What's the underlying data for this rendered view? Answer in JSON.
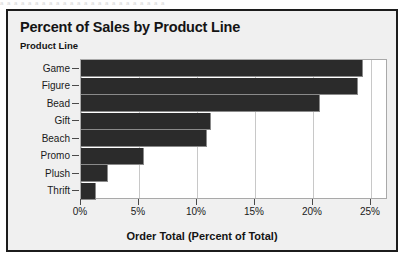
{
  "top_fragment": "a a a a a a a a a a a a a a a a a a a a a a a a",
  "window": {
    "title": "Percent of Sales by Product Line",
    "axis_group_label": "Product Line"
  },
  "colors": {
    "bar": "#2b2b2b",
    "plot_background": "#ffffff",
    "window_background": "#f0f0f0",
    "gridline": "#c8c8c8",
    "border": "#1c1c1c"
  },
  "chart_data": {
    "type": "bar",
    "orientation": "horizontal",
    "title": "Percent of Sales by Product Line",
    "xlabel": "Order Total (Percent of Total)",
    "ylabel": "Product Line",
    "categories": [
      "Game",
      "Figure",
      "Bead",
      "Gift",
      "Beach",
      "Promo",
      "Plush",
      "Thrift"
    ],
    "values": [
      24.3,
      23.9,
      20.6,
      11.2,
      10.9,
      5.4,
      2.3,
      1.3
    ],
    "value_labels": [
      "24.3%",
      "23.9%",
      "20.6%",
      "11.2%",
      "10.9%",
      "5.4%",
      "2.3%",
      "1.3%"
    ],
    "xlim": [
      0,
      26.5
    ],
    "xticks": [
      0,
      5,
      10,
      15,
      20,
      25
    ],
    "xtick_labels": [
      "0%",
      "5%",
      "10%",
      "15%",
      "20%",
      "25%"
    ],
    "grid": true,
    "grid_axis": "x",
    "legend": false
  }
}
